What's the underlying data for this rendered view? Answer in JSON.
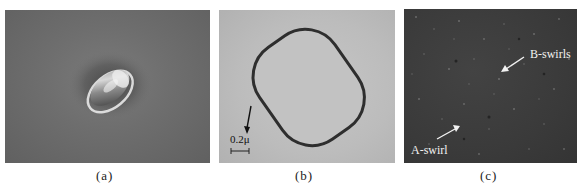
{
  "figure": {
    "panels": [
      {
        "id": "a",
        "caption": "(a)",
        "description": "Grayscale microscope image of a single oval particle with bright halo on dark gray background"
      },
      {
        "id": "b",
        "caption": "(b)",
        "description": "Light-gray micrograph showing a rounded-rectangle outline with dark boundary",
        "scale_bar": "0.2μ"
      },
      {
        "id": "c",
        "caption": "(c)",
        "description": "Dark speckled micrograph of crystal surface with defect annotations",
        "annotations": [
          {
            "label": "B-swirls"
          },
          {
            "label": "A-swirl"
          }
        ]
      }
    ]
  },
  "colors": {
    "panel_a_bg": "#6e6e6e",
    "panel_b_bg": "#bcbcbc",
    "panel_c_bg": "#3a3a3a",
    "outline_b": "#2e2e2e",
    "annotation_c": "#f2f2f2"
  }
}
